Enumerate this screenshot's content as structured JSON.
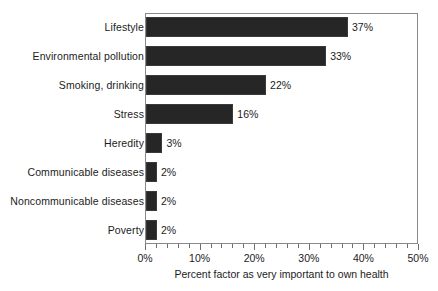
{
  "chart_data": {
    "type": "bar",
    "orientation": "horizontal",
    "title": "",
    "xlabel": "Percent factor as very important to own health",
    "ylabel": "",
    "xlim": [
      0,
      50
    ],
    "xtick_step": 10,
    "xminor_tick_step": 2,
    "grid": false,
    "legend": false,
    "value_suffix": "%",
    "bar_color": "#262626",
    "frame_color": "#8a8a8a",
    "categories": [
      "Lifestyle",
      "Environmental pollution",
      "Smoking, drinking",
      "Stress",
      "Heredity",
      "Communicable diseases",
      "Noncommunicable diseases",
      "Poverty"
    ],
    "values": [
      37,
      33,
      22,
      16,
      3,
      2,
      2,
      2
    ],
    "value_labels": [
      "37%",
      "33%",
      "22%",
      "16%",
      "3%",
      "2%",
      "2%",
      "2%"
    ],
    "xtick_labels": [
      "0%",
      "10%",
      "20%",
      "30%",
      "40%",
      "50%"
    ],
    "xtick_values": [
      0,
      10,
      20,
      30,
      40,
      50
    ]
  }
}
